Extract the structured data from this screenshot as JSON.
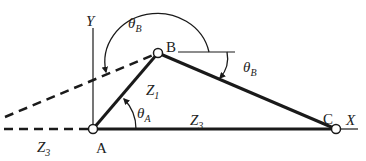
{
  "diagram": {
    "points": {
      "A": {
        "label": "A",
        "x": 93,
        "y": 129
      },
      "B": {
        "label": "B",
        "x": 158,
        "y": 53
      },
      "C": {
        "label": "C",
        "x": 336,
        "y": 129
      }
    },
    "axes": {
      "x_label": "X",
      "y_label": "Y"
    },
    "links": {
      "z1": {
        "label": "Z",
        "sub": "1"
      },
      "z3_main": {
        "label": "Z",
        "sub": "3"
      },
      "z3_dashed": {
        "label": "Z",
        "sub": "3"
      }
    },
    "angles": {
      "theta_a": {
        "label": "θ",
        "sub": "A"
      },
      "theta_b_large": {
        "label": "θ",
        "sub": "B"
      },
      "theta_b_small": {
        "label": "θ",
        "sub": "B"
      }
    },
    "colors": {
      "line": "#1a1a1a",
      "text": "#222222",
      "background": "#ffffff"
    }
  }
}
